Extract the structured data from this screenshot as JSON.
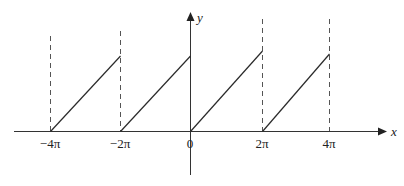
{
  "diagram": {
    "type": "sawtooth-function-plot",
    "axes": {
      "x_label": "x",
      "y_label": "y"
    },
    "tick_labels": [
      {
        "text": "−4π",
        "value": "-4pi"
      },
      {
        "text": "−2π",
        "value": "-2pi"
      },
      {
        "text": "0",
        "value": "0"
      },
      {
        "text": "2π",
        "value": "2pi"
      },
      {
        "text": "4π",
        "value": "4pi"
      }
    ],
    "segments": [
      {
        "from": "-4pi",
        "to": "-2pi"
      },
      {
        "from": "-2pi",
        "to": "0"
      },
      {
        "from": "0",
        "to": "2pi"
      },
      {
        "from": "2pi",
        "to": "4pi"
      }
    ],
    "dashed_verticals_at": [
      "-4pi",
      "-2pi",
      "2pi",
      "4pi"
    ],
    "colors": {
      "line": "#2a2a2a",
      "dashed": "#555555",
      "axis": "#333333"
    }
  }
}
